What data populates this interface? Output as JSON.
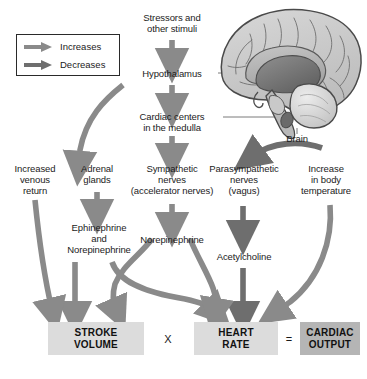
{
  "diagram": {
    "colors": {
      "arrow_increase": "#8a8a8a",
      "arrow_decrease": "#6e6e6e",
      "box_light": "#dcdcdc",
      "box_dark": "#b5b5b5",
      "text": "#1b1b1b",
      "leader_line": "#6b6b6b",
      "brain_outline": "#4a4a4a"
    }
  },
  "legend": {
    "items": [
      {
        "label": "Increases",
        "icon": "right-arrow-icon",
        "color": "#8a8a8a"
      },
      {
        "label": "Decreases",
        "icon": "right-arrow-icon",
        "color": "#6e6e6e"
      }
    ]
  },
  "nodes": {
    "stressors": "Stressors and\nother stimuli",
    "stressors_line1": "Stressors and",
    "stressors_line2": "other stimuli",
    "hypothalamus": "Hypothalamus",
    "cardiac_centers_line1": "Cardiac centers",
    "cardiac_centers_line2": "in the medulla",
    "brain_label": "Brain",
    "increased_venous_return_line1": "Increased",
    "increased_venous_return_line2": "venous",
    "increased_venous_return_line3": "return",
    "adrenal_glands_line1": "Adrenal",
    "adrenal_glands_line2": "glands",
    "sympathetic_line1": "Sympathetic",
    "sympathetic_line2": "nerves",
    "sympathetic_line3": "(accelerator nerves)",
    "parasympathetic_line1": "Parasympathetic",
    "parasympathetic_line2": "nerves",
    "parasympathetic_line3": "(vagus)",
    "body_temp_line1": "Increase",
    "body_temp_line2": "in body",
    "body_temp_line3": "temperature",
    "epinephrine_line1": "Ephinephrine",
    "epinephrine_line2": "and",
    "epinephrine_line3": "Norepinephrine",
    "norepinephrine": "Norepinephrine",
    "acetylcholine": "Acetylcholine"
  },
  "outcome": {
    "stroke_volume_line1": "STROKE",
    "stroke_volume_line2": "VOLUME",
    "multiply_symbol": "X",
    "heart_rate_line1": "HEART",
    "heart_rate_line2": "RATE",
    "equals_symbol": "=",
    "cardiac_output_line1": "CARDIAC",
    "cardiac_output_line2": "OUTPUT"
  }
}
